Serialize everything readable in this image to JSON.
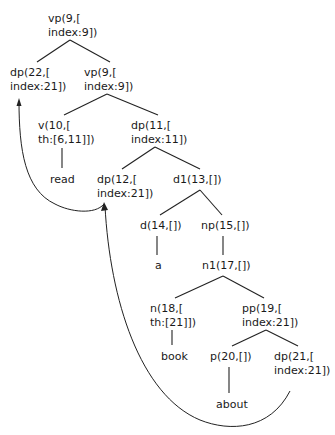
{
  "diagram": {
    "type": "syntax-tree",
    "background": "#ffffff",
    "line_color": "#222222",
    "nodes": [
      {
        "id": "n0",
        "line1": "vp(9,[",
        "line2": "index:9])",
        "x": 48,
        "y": 12
      },
      {
        "id": "n1",
        "line1": "dp(22,[",
        "line2": "index:21])",
        "x": 10,
        "y": 66
      },
      {
        "id": "n2",
        "line1": "vp(9,[",
        "line2": "index:9])",
        "x": 84,
        "y": 66
      },
      {
        "id": "n3",
        "line1": "v(10,[",
        "line2": "th:[6,11]])",
        "x": 38,
        "y": 119
      },
      {
        "id": "n4",
        "line1": "dp(11,[",
        "line2": "index:11])",
        "x": 131,
        "y": 119
      },
      {
        "id": "n5",
        "line1": "read",
        "line2": "",
        "x": 50,
        "y": 173
      },
      {
        "id": "n6",
        "line1": "dp(12,[",
        "line2": "index:21])",
        "x": 97,
        "y": 173
      },
      {
        "id": "n7",
        "line1": "d1(13,[])",
        "line2": "",
        "x": 173,
        "y": 173
      },
      {
        "id": "n8",
        "line1": "d(14,[])",
        "line2": "",
        "x": 140,
        "y": 219
      },
      {
        "id": "n9",
        "line1": "np(15,[])",
        "line2": "",
        "x": 201,
        "y": 219
      },
      {
        "id": "n10",
        "line1": "a",
        "line2": "",
        "x": 155,
        "y": 259
      },
      {
        "id": "n11",
        "line1": "n1(17,[])",
        "line2": "",
        "x": 202,
        "y": 259
      },
      {
        "id": "n12",
        "line1": "n(18,[",
        "line2": "th:[21]])",
        "x": 150,
        "y": 302
      },
      {
        "id": "n13",
        "line1": "pp(19,[",
        "line2": "index:21])",
        "x": 242,
        "y": 302
      },
      {
        "id": "n14",
        "line1": "book",
        "line2": "",
        "x": 161,
        "y": 350
      },
      {
        "id": "n15",
        "line1": "p(20,[])",
        "line2": "",
        "x": 210,
        "y": 350
      },
      {
        "id": "n16",
        "line1": "dp(21,[",
        "line2": "index:21])",
        "x": 274,
        "y": 350
      },
      {
        "id": "n17",
        "line1": "about",
        "line2": "",
        "x": 216,
        "y": 398
      }
    ],
    "edges": [
      {
        "from": "n0",
        "to": "n1",
        "x1": 70,
        "y1": 40,
        "x2": 37,
        "y2": 62
      },
      {
        "from": "n0",
        "to": "n2",
        "x1": 70,
        "y1": 40,
        "x2": 110,
        "y2": 62
      },
      {
        "from": "n2",
        "to": "n3",
        "x1": 107,
        "y1": 94,
        "x2": 64,
        "y2": 115
      },
      {
        "from": "n2",
        "to": "n4",
        "x1": 107,
        "y1": 94,
        "x2": 158,
        "y2": 115
      },
      {
        "from": "n3",
        "to": "n5",
        "x1": 62,
        "y1": 148,
        "x2": 62,
        "y2": 168
      },
      {
        "from": "n4",
        "to": "n6",
        "x1": 155,
        "y1": 147,
        "x2": 122,
        "y2": 169
      },
      {
        "from": "n4",
        "to": "n7",
        "x1": 155,
        "y1": 147,
        "x2": 200,
        "y2": 169
      },
      {
        "from": "n7",
        "to": "n8",
        "x1": 200,
        "y1": 190,
        "x2": 160,
        "y2": 215
      },
      {
        "from": "n7",
        "to": "n9",
        "x1": 200,
        "y1": 190,
        "x2": 222,
        "y2": 215
      },
      {
        "from": "n8",
        "to": "n10",
        "x1": 157,
        "y1": 236,
        "x2": 157,
        "y2": 255
      },
      {
        "from": "n9",
        "to": "n11",
        "x1": 223,
        "y1": 236,
        "x2": 223,
        "y2": 255
      },
      {
        "from": "n11",
        "to": "n12",
        "x1": 223,
        "y1": 276,
        "x2": 175,
        "y2": 298
      },
      {
        "from": "n11",
        "to": "n13",
        "x1": 223,
        "y1": 276,
        "x2": 264,
        "y2": 298
      },
      {
        "from": "n12",
        "to": "n14",
        "x1": 172,
        "y1": 330,
        "x2": 172,
        "y2": 345
      },
      {
        "from": "n13",
        "to": "n15",
        "x1": 266,
        "y1": 330,
        "x2": 232,
        "y2": 346
      },
      {
        "from": "n13",
        "to": "n16",
        "x1": 266,
        "y1": 330,
        "x2": 298,
        "y2": 346
      },
      {
        "from": "n15",
        "to": "n17",
        "x1": 229,
        "y1": 367,
        "x2": 229,
        "y2": 393
      }
    ],
    "movement_arrows": [
      {
        "from": "n6",
        "to": "n1",
        "path": "M104,204 C95,215 70,212 55,204 C25,190 19,150 19,101",
        "head": "19,98 16.5,106 21.5,106"
      },
      {
        "from": "n16",
        "to": "n6",
        "path": "M290,391 C270,430 230,432 200,420 C140,395 110,300 105,206",
        "head": "104,202 101,211 108,210"
      }
    ]
  }
}
